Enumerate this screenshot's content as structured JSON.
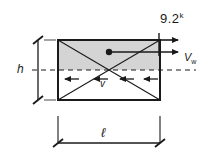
{
  "figure": {
    "type": "structural-shear-wall-diagram",
    "background_color": "#ffffff",
    "line_color": "#1a1a1a",
    "wall_fill_color": "#d4d4d4",
    "labels": {
      "applied_load": "9.2",
      "applied_load_superscript": "k",
      "shear_force": "V",
      "shear_force_subscript": "w",
      "height": "h",
      "length": "ℓ",
      "internal_shear": "v"
    },
    "wall": {
      "x": 58,
      "y": 40,
      "width": 102,
      "height": 60,
      "fill": "#d4d4d4",
      "stroke_width": 2
    },
    "midline": {
      "style": "dashed",
      "y": 70,
      "x_start": 32,
      "x_end": 196
    },
    "diagonals": 2,
    "centroid_dot": {
      "x": 109,
      "y": 52,
      "r": 3
    },
    "load_arrows_right": 2,
    "shear_arrows_left": 4,
    "dimension_tick_style": "architectural-slash"
  }
}
